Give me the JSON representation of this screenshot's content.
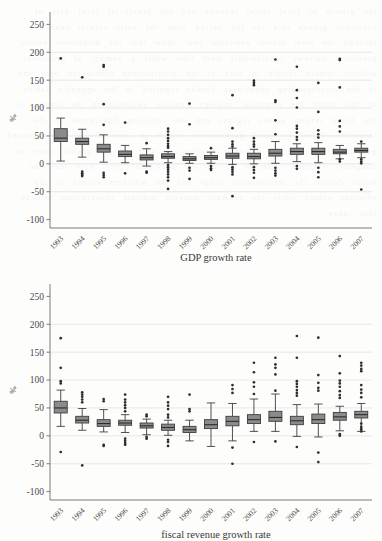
{
  "page": {
    "background_color": "#fdfdfc",
    "box_fill_color": "#8b8b8b",
    "box_stroke_color": "#3d3d3d",
    "grid_color": "#e2e2e4",
    "axis_color": "#7a7a7a",
    "outlier_color": "#2e2e2e"
  },
  "chart_data": [
    {
      "id": "gdp-growth-rate",
      "type": "box",
      "title": "",
      "xlabel": "GDP growth rate",
      "ylabel": "%",
      "ylim": [
        -115,
        265
      ],
      "yticks": [
        250,
        200,
        150,
        100,
        50,
        0,
        -50,
        -100
      ],
      "ytick_labels": [
        "250",
        "200",
        "150",
        "100",
        "50",
        "0",
        "-50",
        "-100"
      ],
      "grid": true,
      "grid_values": [
        200,
        150,
        100,
        50,
        0,
        -50
      ],
      "legend": "none",
      "categories": [
        "1993",
        "1994",
        "1995",
        "1996",
        "1997",
        "1998",
        "1999",
        "2000",
        "2001",
        "2002",
        "2003",
        "2004",
        "2005",
        "2006",
        "2007"
      ],
      "boxes": [
        {
          "category": "1993",
          "whisker_low": 5,
          "q1": 40,
          "median": 46,
          "q3": 63,
          "whisker_high": 82,
          "outliers": [
            189
          ]
        },
        {
          "category": "1994",
          "whisker_low": 12,
          "q1": 35,
          "median": 40,
          "q3": 46,
          "whisker_high": 62,
          "outliers": [
            155,
            -14,
            -17,
            -20,
            -22
          ]
        },
        {
          "category": "1995",
          "whisker_low": 3,
          "q1": 21,
          "median": 27,
          "q3": 35,
          "whisker_high": 52,
          "outliers": [
            177,
            174,
            107,
            70,
            -16,
            -20,
            -24
          ]
        },
        {
          "category": "1996",
          "whisker_low": 2,
          "q1": 13,
          "median": 17,
          "q3": 23,
          "whisker_high": 33,
          "outliers": [
            74,
            -17
          ]
        },
        {
          "category": "1997",
          "whisker_low": -4,
          "q1": 7,
          "median": 11,
          "q3": 16,
          "whisker_high": 27,
          "outliers": [
            37,
            -14,
            -16
          ]
        },
        {
          "category": "1998",
          "whisker_low": 2,
          "q1": 10,
          "median": 13,
          "q3": 18,
          "whisker_high": 22,
          "outliers": [
            63,
            58,
            52,
            46,
            41,
            36,
            32,
            29,
            -2,
            -6,
            -10,
            -14,
            -19,
            -24,
            -30,
            -45
          ]
        },
        {
          "category": "1999",
          "whisker_low": 1,
          "q1": 6,
          "median": 9,
          "q3": 13,
          "whisker_high": 18,
          "outliers": [
            108,
            71,
            -7,
            -12,
            -27
          ]
        },
        {
          "category": "2000",
          "whisker_low": 1,
          "q1": 8,
          "median": 11,
          "q3": 15,
          "whisker_high": 21,
          "outliers": [
            28,
            -4,
            -8,
            -11
          ]
        },
        {
          "category": "2001",
          "whisker_low": -1,
          "q1": 10,
          "median": 14,
          "q3": 19,
          "whisker_high": 28,
          "outliers": [
            123,
            64,
            40,
            35,
            31,
            -6,
            -10,
            -14,
            -19,
            -58
          ]
        },
        {
          "category": "2002",
          "whisker_low": 0,
          "q1": 9,
          "median": 13,
          "q3": 19,
          "whisker_high": 26,
          "outliers": [
            149,
            145,
            141,
            46,
            40,
            35,
            31,
            -6,
            -11,
            -16,
            -25
          ]
        },
        {
          "category": "2003",
          "whisker_low": 1,
          "q1": 14,
          "median": 19,
          "q3": 26,
          "whisker_high": 40,
          "outliers": [
            187,
            114,
            111,
            78,
            53,
            -7,
            -12,
            -17,
            -21
          ]
        },
        {
          "category": "2004",
          "whisker_low": 4,
          "q1": 17,
          "median": 22,
          "q3": 28,
          "whisker_high": 36,
          "outliers": [
            174,
            132,
            118,
            101,
            68,
            63,
            56,
            48,
            43,
            -4,
            -9
          ]
        },
        {
          "category": "2005",
          "whisker_low": 2,
          "q1": 17,
          "median": 22,
          "q3": 28,
          "whisker_high": 38,
          "outliers": [
            145,
            93,
            60,
            53,
            47,
            -7,
            -15,
            -24
          ]
        },
        {
          "category": "2006",
          "whisker_low": 9,
          "q1": 18,
          "median": 21,
          "q3": 26,
          "whisker_high": 33,
          "outliers": [
            188,
            186,
            137,
            77,
            67,
            58,
            8,
            4
          ]
        },
        {
          "category": "2007",
          "whisker_low": 11,
          "q1": 21,
          "median": 24,
          "q3": 28,
          "whisker_high": 36,
          "outliers": [
            40,
            8,
            4,
            1,
            -46
          ]
        }
      ]
    },
    {
      "id": "fiscal-revenue-growth-rate",
      "type": "box",
      "title": "",
      "xlabel": "fiscal revenue growth rate",
      "ylabel": "%",
      "ylim": [
        -115,
        265
      ],
      "yticks": [
        250,
        200,
        150,
        100,
        50,
        0,
        -50,
        -100
      ],
      "ytick_labels": [
        "250",
        "200",
        "150",
        "100",
        "50",
        "0",
        "-50",
        "-100"
      ],
      "grid": true,
      "grid_values": [
        200,
        150,
        100,
        50,
        0,
        -50
      ],
      "legend": "none",
      "categories": [
        "1993",
        "1994",
        "1995",
        "1996",
        "1997",
        "1998",
        "1999",
        "2000",
        "2001",
        "2002",
        "2003",
        "2004",
        "2005",
        "2006",
        "2007"
      ],
      "boxes": [
        {
          "category": "1993",
          "whisker_low": 17,
          "q1": 41,
          "median": 50,
          "q3": 62,
          "whisker_high": 82,
          "outliers": [
            175,
            122,
            98,
            94,
            -29
          ]
        },
        {
          "category": "1994",
          "whisker_low": 10,
          "q1": 23,
          "median": 28,
          "q3": 35,
          "whisker_high": 49,
          "outliers": [
            78,
            74,
            70,
            65,
            60,
            -53
          ]
        },
        {
          "category": "1995",
          "whisker_low": 7,
          "q1": 17,
          "median": 22,
          "q3": 29,
          "whisker_high": 47,
          "outliers": [
            66,
            62,
            -16,
            -18
          ]
        },
        {
          "category": "1996",
          "whisker_low": 6,
          "q1": 19,
          "median": 23,
          "q3": 28,
          "whisker_high": 38,
          "outliers": [
            74,
            65,
            60,
            55,
            50,
            44,
            -5,
            -9,
            -13,
            -16
          ]
        },
        {
          "category": "1997",
          "whisker_low": 2,
          "q1": 14,
          "median": 18,
          "q3": 23,
          "whisker_high": 30,
          "outliers": [
            38,
            35,
            -2,
            -5
          ]
        },
        {
          "category": "1998",
          "whisker_low": 1,
          "q1": 10,
          "median": 15,
          "q3": 21,
          "whisker_high": 28,
          "outliers": [
            70,
            60,
            54,
            48,
            38,
            33,
            -7,
            -11,
            -18
          ]
        },
        {
          "category": "1999",
          "whisker_low": -9,
          "q1": 6,
          "median": 11,
          "q3": 17,
          "whisker_high": 28,
          "outliers": [
            74,
            48,
            44
          ]
        },
        {
          "category": "2000",
          "whisker_low": -19,
          "q1": 13,
          "median": 20,
          "q3": 29,
          "whisker_high": 59,
          "outliers": []
        },
        {
          "category": "2001",
          "whisker_low": -9,
          "q1": 18,
          "median": 26,
          "q3": 35,
          "whisker_high": 58,
          "outliers": [
            91,
            84,
            77,
            -21,
            -50
          ]
        },
        {
          "category": "2002",
          "whisker_low": 8,
          "q1": 22,
          "median": 29,
          "q3": 38,
          "whisker_high": 66,
          "outliers": [
            131,
            114,
            96,
            88,
            75,
            -11
          ]
        },
        {
          "category": "2003",
          "whisker_low": 8,
          "q1": 26,
          "median": 33,
          "q3": 44,
          "whisker_high": 75,
          "outliers": [
            140,
            128,
            122,
            110,
            81,
            -10
          ]
        },
        {
          "category": "2004",
          "whisker_low": -1,
          "q1": 20,
          "median": 27,
          "q3": 35,
          "whisker_high": 56,
          "outliers": [
            179,
            140,
            98,
            93,
            88,
            82,
            77,
            72,
            -20
          ]
        },
        {
          "category": "2005",
          "whisker_low": -2,
          "q1": 22,
          "median": 29,
          "q3": 39,
          "whisker_high": 57,
          "outliers": [
            176,
            109,
            95,
            86,
            81,
            -30,
            -47
          ]
        },
        {
          "category": "2006",
          "whisker_low": 9,
          "q1": 28,
          "median": 34,
          "q3": 42,
          "whisker_high": 53,
          "outliers": [
            143,
            112,
            99,
            94,
            88,
            80,
            73,
            68,
            3,
            0
          ]
        },
        {
          "category": "2007",
          "whisker_low": 8,
          "q1": 32,
          "median": 38,
          "q3": 44,
          "whisker_high": 58,
          "outliers": [
            131,
            126,
            120,
            116,
            91,
            83,
            77,
            69,
            22,
            16,
            12,
            8
          ]
        }
      ]
    }
  ]
}
